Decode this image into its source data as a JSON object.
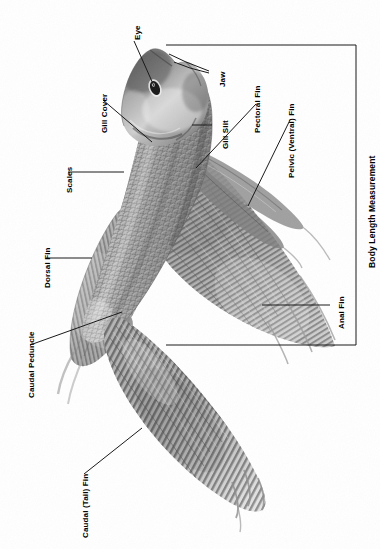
{
  "figure": {
    "background_color": "#ffffff",
    "line_color": "#1a1a1a",
    "text_color": "#000000",
    "orientation_note": "labels rotated 90 degrees counter-clockwise"
  },
  "labels": {
    "eye": "Eye",
    "jaw": "Jaw",
    "gill_cover": "Gill Cover",
    "gill_slit": "Gill Slit",
    "scales": "Scales",
    "dorsal_fin": "Dorsal Fin",
    "pectoral_fin": "Pectoral Fin",
    "pelvic_fin": "Pelvic (Ventral) Fin",
    "anal_fin": "Anal Fin",
    "caudal_peduncle": "Caudal Peduncle",
    "caudal_fin": "Caudal (Tail) Fin",
    "body_length": "Body Length Measurement"
  }
}
